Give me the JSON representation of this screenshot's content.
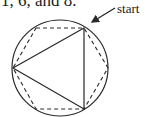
{
  "caption": "1, 6, and 8.",
  "start_label": "start",
  "figure": {
    "circle": {
      "cx": 60,
      "cy": 68,
      "r": 48
    },
    "triangle": [
      [
        84,
        28
      ],
      [
        13,
        68
      ],
      [
        84,
        109
      ]
    ],
    "hexagon_dashed": [
      [
        36,
        28
      ],
      [
        84,
        28
      ],
      [
        108,
        68
      ],
      [
        84,
        109
      ],
      [
        36,
        109
      ],
      [
        13,
        68
      ]
    ],
    "arrow": {
      "from": [
        115,
        8
      ],
      "to": [
        92,
        22
      ]
    },
    "stroke_color": "#2a2a2a"
  }
}
